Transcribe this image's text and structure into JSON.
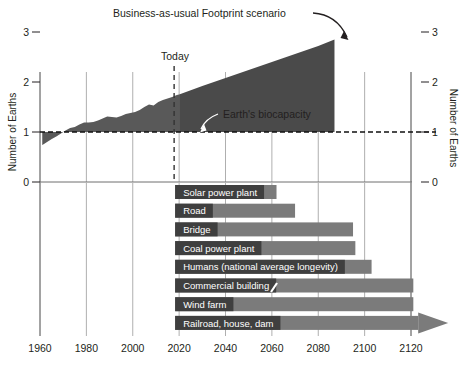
{
  "chart_title": "Business-as-usual Footprint scenario",
  "annotations": [
    {
      "name": "today-label",
      "text": "Today"
    },
    {
      "name": "biocapacity-label",
      "text": "Earth's biocapacity"
    }
  ],
  "axes": {
    "left": {
      "title": "Number of Earths",
      "ticks": [
        "0",
        "1",
        "2",
        "3"
      ]
    },
    "right": {
      "title": "Number of Earths",
      "ticks": [
        "0",
        "1",
        "2",
        "3"
      ]
    },
    "bottom": {
      "ticks": [
        "1960",
        "1980",
        "2000",
        "2020",
        "2040",
        "2060",
        "2080",
        "2100",
        "2120"
      ]
    }
  },
  "colors": {
    "footprint_history": "#595959",
    "footprint_projection": "#4a4a4a",
    "reserve": "#cfcfcf",
    "bar": "#7b7b7b",
    "bar_label_bg": "#3f3f3f",
    "grid": "#9b9b9b",
    "axis": "#6f6f6f",
    "text": "#231f20"
  },
  "chart_data": {
    "type": "area",
    "title": "Business-as-usual Footprint scenario",
    "xlabel": "",
    "ylabel": "Number of Earths",
    "xlim": [
      1960,
      2130
    ],
    "ylim": [
      0,
      3.2
    ],
    "grid": true,
    "legend": "none",
    "biocapacity_line": 1.0,
    "today_year": 2020,
    "series": [
      {
        "name": "Ecological Footprint (history)",
        "type": "area",
        "x": [
          1961,
          1963,
          1965,
          1967,
          1969,
          1971,
          1973,
          1975,
          1977,
          1979,
          1981,
          1983,
          1985,
          1987,
          1989,
          1991,
          1993,
          1995,
          1997,
          1999,
          2001,
          2003,
          2005,
          2007,
          2009,
          2011,
          2013,
          2015,
          2017,
          2019,
          2020
        ],
        "values": [
          0.74,
          0.8,
          0.86,
          0.91,
          0.97,
          1.03,
          1.08,
          1.1,
          1.15,
          1.19,
          1.19,
          1.2,
          1.23,
          1.27,
          1.31,
          1.3,
          1.29,
          1.32,
          1.36,
          1.38,
          1.4,
          1.44,
          1.5,
          1.55,
          1.53,
          1.6,
          1.64,
          1.67,
          1.7,
          1.74,
          1.75
        ]
      },
      {
        "name": "Business-as-usual projection",
        "type": "area",
        "x": [
          2020,
          2030,
          2040,
          2050,
          2060,
          2070,
          2080,
          2087
        ],
        "values": [
          1.75,
          1.92,
          2.08,
          2.24,
          2.4,
          2.56,
          2.72,
          2.85
        ]
      },
      {
        "name": "Ecological reserve (pre-overshoot)",
        "type": "area",
        "x": [
          1961,
          1970
        ],
        "values": [
          0.74,
          1.0
        ]
      }
    ],
    "lifespan_bars": {
      "name": "Typical lifespan of long-lived assets",
      "unit": "year",
      "start_year": 2020,
      "categories": [
        "Solar power plant",
        "Road",
        "Bridge",
        "Coal power plant",
        "Humans (national average longevity)",
        "Commercial building",
        "Wind farm",
        "Railroad, house, dam"
      ],
      "end_years": [
        2062,
        2070,
        2095,
        2096,
        2103,
        2121,
        2121,
        2130
      ],
      "open_ended": [
        false,
        false,
        false,
        false,
        false,
        false,
        false,
        true
      ]
    }
  },
  "bars": [
    {
      "label": "Solar power plant"
    },
    {
      "label": "Road"
    },
    {
      "label": "Bridge"
    },
    {
      "label": "Coal power plant"
    },
    {
      "label": "Humans (national average longevity)"
    },
    {
      "label": "Commercial building"
    },
    {
      "label": "Wind farm"
    },
    {
      "label": "Railroad, house, dam"
    }
  ]
}
